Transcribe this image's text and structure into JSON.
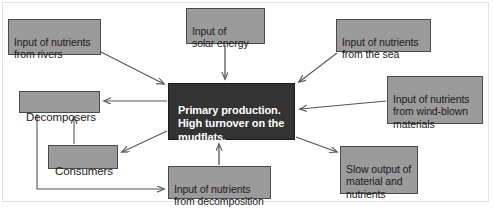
{
  "diagram": {
    "background_color": "#ffffff",
    "box_fill": "#9b9b9b",
    "box_border": "#4a4a4a",
    "center_fill": "#333333",
    "center_text_color": "#ffffff",
    "arrow_color": "#555555",
    "nodes": [
      {
        "id": "rivers",
        "label": "Input of nutrients\nfrom rivers",
        "x": 8,
        "y": 19,
        "w": 93,
        "h": 36
      },
      {
        "id": "solar",
        "label": "Input of\nsolar energy",
        "x": 186,
        "y": 8,
        "w": 79,
        "h": 36
      },
      {
        "id": "sea",
        "label": "Input of nutrients\nfrom the sea",
        "x": 336,
        "y": 19,
        "w": 95,
        "h": 33
      },
      {
        "id": "wind",
        "label": "Input of nutrients\nfrom wind-blown\nmaterials",
        "x": 387,
        "y": 76,
        "w": 96,
        "h": 48
      },
      {
        "id": "center",
        "label": "Primary production.\nHigh turnover on the\nmudflats.",
        "x": 168,
        "y": 83,
        "w": 127,
        "h": 57
      },
      {
        "id": "decomposers",
        "label": "Decomposers",
        "x": 19,
        "y": 91,
        "w": 81,
        "h": 22
      },
      {
        "id": "consumers",
        "label": "Consumers",
        "x": 48,
        "y": 145,
        "w": 70,
        "h": 24
      },
      {
        "id": "decomposition",
        "label": "Input of nutrients\nfrom decomposition",
        "x": 168,
        "y": 166,
        "w": 103,
        "h": 33
      },
      {
        "id": "slow_output",
        "label": "Slow output of\nmaterial and\nnutrients",
        "x": 340,
        "y": 146,
        "w": 78,
        "h": 48
      }
    ],
    "edges": [
      {
        "id": "rivers-to-center",
        "from": "rivers",
        "to": "center",
        "arrowhead": true
      },
      {
        "id": "solar-to-center",
        "from": "solar",
        "to": "center",
        "arrowhead": true
      },
      {
        "id": "sea-to-center",
        "from": "sea",
        "to": "center",
        "arrowhead": true
      },
      {
        "id": "wind-to-center",
        "from": "wind",
        "to": "center",
        "arrowhead": true
      },
      {
        "id": "center-to-decomposers",
        "from": "center",
        "to": "decomposers",
        "arrowhead": true
      },
      {
        "id": "center-to-consumers",
        "from": "center",
        "to": "consumers",
        "arrowhead": true
      },
      {
        "id": "consumers-to-decomposers",
        "from": "consumers",
        "to": "decomposers",
        "arrowhead": true
      },
      {
        "id": "decomposers-to-decomposition",
        "from": "decomposers",
        "to": "decomposition",
        "arrowhead": true
      },
      {
        "id": "decomposition-to-center",
        "from": "decomposition",
        "to": "center",
        "arrowhead": true
      },
      {
        "id": "center-to-slow-output",
        "from": "center",
        "to": "slow_output",
        "arrowhead": true
      }
    ]
  }
}
